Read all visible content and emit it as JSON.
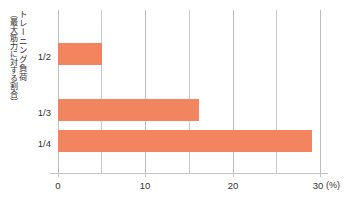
{
  "chart_data": {
    "type": "bar",
    "orientation": "horizontal",
    "title": "",
    "subtitle": "",
    "categories": [
      "1/2",
      "1/3",
      "1/4"
    ],
    "values": [
      5.0,
      16.1,
      29.1
    ],
    "series": [
      {
        "name": "",
        "values": [
          5.0,
          16.1,
          29.1
        ]
      }
    ],
    "xlabel": "(%)",
    "ylabel": "トレーニング負荷（最大筋力に対する割合）",
    "ylabel_main": "トレーニング負荷",
    "ylabel_sub": "（最大筋力に対する割合）",
    "xlim": [
      0,
      30
    ],
    "xticks": [
      0,
      10,
      20,
      30
    ],
    "xtick_labels": [
      "0",
      "10",
      "20",
      "30"
    ],
    "gridlines_x": [
      0,
      5,
      10,
      15,
      20,
      25,
      30
    ],
    "grid": true,
    "legend": false,
    "legend_position": "none",
    "bar_color": "#f28460",
    "grid_color": "#c9c9c9",
    "axis_color": "#c4c4c4",
    "unit_label": "(%)"
  },
  "axis": {
    "x_unit": "(%)",
    "tick_0": "0",
    "tick_10": "10",
    "tick_20": "20",
    "tick_30": "30"
  },
  "ylabel": {
    "main": "トレーニング負荷",
    "sub": "（最大筋力に対する割合）"
  },
  "categories": {
    "c0": "1/2",
    "c1": "1/3",
    "c2": "1/4"
  }
}
